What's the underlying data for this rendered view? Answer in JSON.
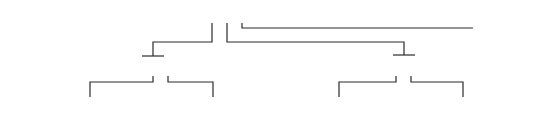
{
  "diagram": {
    "top_row": {
      "digits": [
        "2",
        "3",
        "4",
        "5",
        "6",
        "7",
        "8",
        "9"
      ],
      "x": [
        212,
        227,
        242,
        257,
        272,
        286,
        300,
        314
      ],
      "y": 21
    },
    "middle_left": {
      "digits": [
        "0",
        "1"
      ],
      "x": [
        152,
        167
      ],
      "y": 74
    },
    "middle_right": {
      "digits": [
        "0",
        "1"
      ],
      "x": [
        396,
        411
      ],
      "y": 74
    },
    "bottom_row": {
      "digits": [
        "1",
        "2",
        "3",
        "4",
        "5",
        "6",
        "7",
        "8",
        "9",
        "2",
        "3",
        "4",
        "5",
        "6",
        "7",
        "8",
        "9",
        "1",
        "2",
        "3",
        "4",
        "5",
        "6",
        "7",
        "8",
        "9",
        "2",
        "3",
        "4",
        "5",
        "6"
      ],
      "start_x": 28,
      "step": 15.2,
      "y": 113,
      "ellipsis": "..."
    },
    "baseline_segments": [
      {
        "x1": 23,
        "x2": 150,
        "y": 97
      },
      {
        "x1": 158,
        "x2": 268,
        "y": 97
      },
      {
        "x1": 276,
        "x2": 498,
        "y": 97
      }
    ]
  }
}
